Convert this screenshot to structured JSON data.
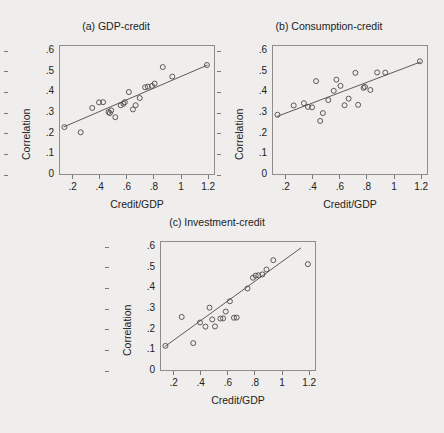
{
  "figure": {
    "axis_label_x": "Credit/GDP",
    "axis_label_y": "Correlation",
    "marker": "open-circle",
    "line_color": "#4a4a4a",
    "marker_color": "#4a4a4a",
    "background": "#f0eeec",
    "x_ticks": [
      ".2",
      ".4",
      ".6",
      ".8",
      "1",
      "1.2"
    ],
    "x_tick_values": [
      0.2,
      0.4,
      0.6,
      0.8,
      1.0,
      1.2
    ],
    "y_ticks": [
      "0",
      ".1",
      ".2",
      ".3",
      ".4",
      ".5",
      ".6"
    ],
    "y_tick_values": [
      0,
      0.1,
      0.2,
      0.3,
      0.4,
      0.5,
      0.6
    ]
  },
  "chart_data": [
    {
      "type": "scatter",
      "panel": "a",
      "title": "(a) GDP-credit",
      "xlabel": "Credit/GDP",
      "ylabel": "Correlation",
      "xlim": [
        0.1,
        1.25
      ],
      "ylim": [
        0.0,
        0.63
      ],
      "grid": false,
      "legend": "none",
      "points": [
        {
          "x": 0.14,
          "y": 0.232
        },
        {
          "x": 0.26,
          "y": 0.207
        },
        {
          "x": 0.345,
          "y": 0.325
        },
        {
          "x": 0.395,
          "y": 0.352
        },
        {
          "x": 0.425,
          "y": 0.353
        },
        {
          "x": 0.465,
          "y": 0.305
        },
        {
          "x": 0.475,
          "y": 0.3
        },
        {
          "x": 0.485,
          "y": 0.313
        },
        {
          "x": 0.515,
          "y": 0.28
        },
        {
          "x": 0.555,
          "y": 0.338
        },
        {
          "x": 0.575,
          "y": 0.345
        },
        {
          "x": 0.585,
          "y": 0.353
        },
        {
          "x": 0.615,
          "y": 0.402
        },
        {
          "x": 0.645,
          "y": 0.318
        },
        {
          "x": 0.665,
          "y": 0.338
        },
        {
          "x": 0.695,
          "y": 0.373
        },
        {
          "x": 0.735,
          "y": 0.425
        },
        {
          "x": 0.755,
          "y": 0.428
        },
        {
          "x": 0.785,
          "y": 0.432
        },
        {
          "x": 0.805,
          "y": 0.443
        },
        {
          "x": 0.865,
          "y": 0.523
        },
        {
          "x": 0.935,
          "y": 0.477
        },
        {
          "x": 1.19,
          "y": 0.533
        }
      ],
      "fit_line": {
        "x1": 0.135,
        "y1": 0.233,
        "x2": 1.195,
        "y2": 0.533
      }
    },
    {
      "type": "scatter",
      "panel": "b",
      "title": "(b) Consumption-credit",
      "xlabel": "Credit/GDP",
      "ylabel": "Correlation",
      "xlim": [
        0.1,
        1.25
      ],
      "ylim": [
        0.0,
        0.63
      ],
      "grid": false,
      "legend": "none",
      "points": [
        {
          "x": 0.14,
          "y": 0.292
        },
        {
          "x": 0.26,
          "y": 0.337
        },
        {
          "x": 0.335,
          "y": 0.348
        },
        {
          "x": 0.365,
          "y": 0.33
        },
        {
          "x": 0.395,
          "y": 0.328
        },
        {
          "x": 0.425,
          "y": 0.455
        },
        {
          "x": 0.455,
          "y": 0.262
        },
        {
          "x": 0.475,
          "y": 0.3
        },
        {
          "x": 0.515,
          "y": 0.363
        },
        {
          "x": 0.555,
          "y": 0.408
        },
        {
          "x": 0.575,
          "y": 0.462
        },
        {
          "x": 0.605,
          "y": 0.432
        },
        {
          "x": 0.635,
          "y": 0.338
        },
        {
          "x": 0.665,
          "y": 0.37
        },
        {
          "x": 0.715,
          "y": 0.495
        },
        {
          "x": 0.735,
          "y": 0.34
        },
        {
          "x": 0.775,
          "y": 0.422
        },
        {
          "x": 0.785,
          "y": 0.427
        },
        {
          "x": 0.825,
          "y": 0.412
        },
        {
          "x": 0.875,
          "y": 0.497
        },
        {
          "x": 0.935,
          "y": 0.496
        },
        {
          "x": 1.19,
          "y": 0.551
        }
      ],
      "fit_line": {
        "x1": 0.135,
        "y1": 0.283,
        "x2": 1.195,
        "y2": 0.548
      }
    },
    {
      "type": "scatter",
      "panel": "c",
      "title": "(c) Investment-credit",
      "xlabel": "Credit/GDP",
      "ylabel": "Correlation",
      "xlim": [
        0.1,
        1.25
      ],
      "ylim": [
        0.0,
        0.63
      ],
      "grid": false,
      "legend": "none",
      "points": [
        {
          "x": 0.14,
          "y": 0.122
        },
        {
          "x": 0.26,
          "y": 0.262
        },
        {
          "x": 0.345,
          "y": 0.135
        },
        {
          "x": 0.395,
          "y": 0.235
        },
        {
          "x": 0.435,
          "y": 0.215
        },
        {
          "x": 0.465,
          "y": 0.307
        },
        {
          "x": 0.485,
          "y": 0.25
        },
        {
          "x": 0.505,
          "y": 0.216
        },
        {
          "x": 0.545,
          "y": 0.254
        },
        {
          "x": 0.565,
          "y": 0.255
        },
        {
          "x": 0.585,
          "y": 0.288
        },
        {
          "x": 0.615,
          "y": 0.338
        },
        {
          "x": 0.645,
          "y": 0.258
        },
        {
          "x": 0.665,
          "y": 0.259
        },
        {
          "x": 0.745,
          "y": 0.4
        },
        {
          "x": 0.785,
          "y": 0.452
        },
        {
          "x": 0.805,
          "y": 0.462
        },
        {
          "x": 0.825,
          "y": 0.464
        },
        {
          "x": 0.855,
          "y": 0.468
        },
        {
          "x": 0.885,
          "y": 0.492
        },
        {
          "x": 0.935,
          "y": 0.537
        },
        {
          "x": 1.19,
          "y": 0.518
        }
      ],
      "fit_line": {
        "x1": 0.135,
        "y1": 0.118,
        "x2": 1.14,
        "y2": 0.597
      }
    }
  ]
}
